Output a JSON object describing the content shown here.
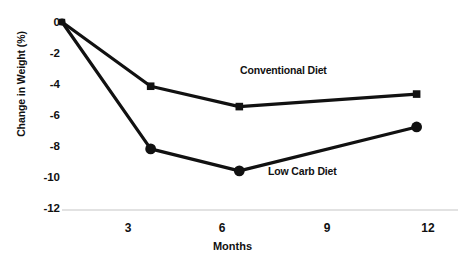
{
  "chart_data": {
    "type": "line",
    "title": "",
    "xlabel": "Months",
    "ylabel": "Change in Weight (%)",
    "x": [
      0,
      3,
      6,
      12
    ],
    "xtick_labels": [
      "3",
      "6",
      "9",
      "12"
    ],
    "xtick_values": [
      3,
      6,
      9,
      12
    ],
    "ytick_labels": [
      "0",
      "-2",
      "-4",
      "-6",
      "-8",
      "-10",
      "-12"
    ],
    "ytick_values": [
      0,
      -2,
      -4,
      -6,
      -8,
      -10,
      -12
    ],
    "xlim": [
      0,
      13.4
    ],
    "ylim": [
      -12,
      0
    ],
    "grid": false,
    "legend_position": "inline-annotations",
    "series": [
      {
        "name": "Conventional Diet",
        "marker": "square",
        "color": "#111111",
        "x": [
          0,
          3,
          6,
          12
        ],
        "values": [
          0,
          -4.1,
          -5.4,
          -4.6
        ]
      },
      {
        "name": "Low Carb Diet",
        "marker": "circle",
        "color": "#111111",
        "x": [
          0,
          3,
          6,
          12
        ],
        "values": [
          0,
          -8.1,
          -9.5,
          -6.7
        ]
      }
    ],
    "annotations": [
      {
        "text": "Conventional Diet",
        "x": 7.6,
        "y": -2.7
      },
      {
        "text": "Low Carb Diet",
        "x": 9.1,
        "y": -9.2
      }
    ],
    "axis_line_color": "#d8d8d8",
    "line_color": "#111111",
    "background": "#ffffff"
  },
  "ticks": {
    "y": [
      "0",
      "-2",
      "-4",
      "-6",
      "-8",
      "-10",
      "-12"
    ],
    "x": [
      "3",
      "6",
      "9",
      "12"
    ]
  },
  "labels": {
    "y_axis_title": "Change in Weight (%)",
    "x_axis_title": "Months",
    "series_conventional": "Conventional Diet",
    "series_lowcarb": "Low Carb Diet"
  }
}
